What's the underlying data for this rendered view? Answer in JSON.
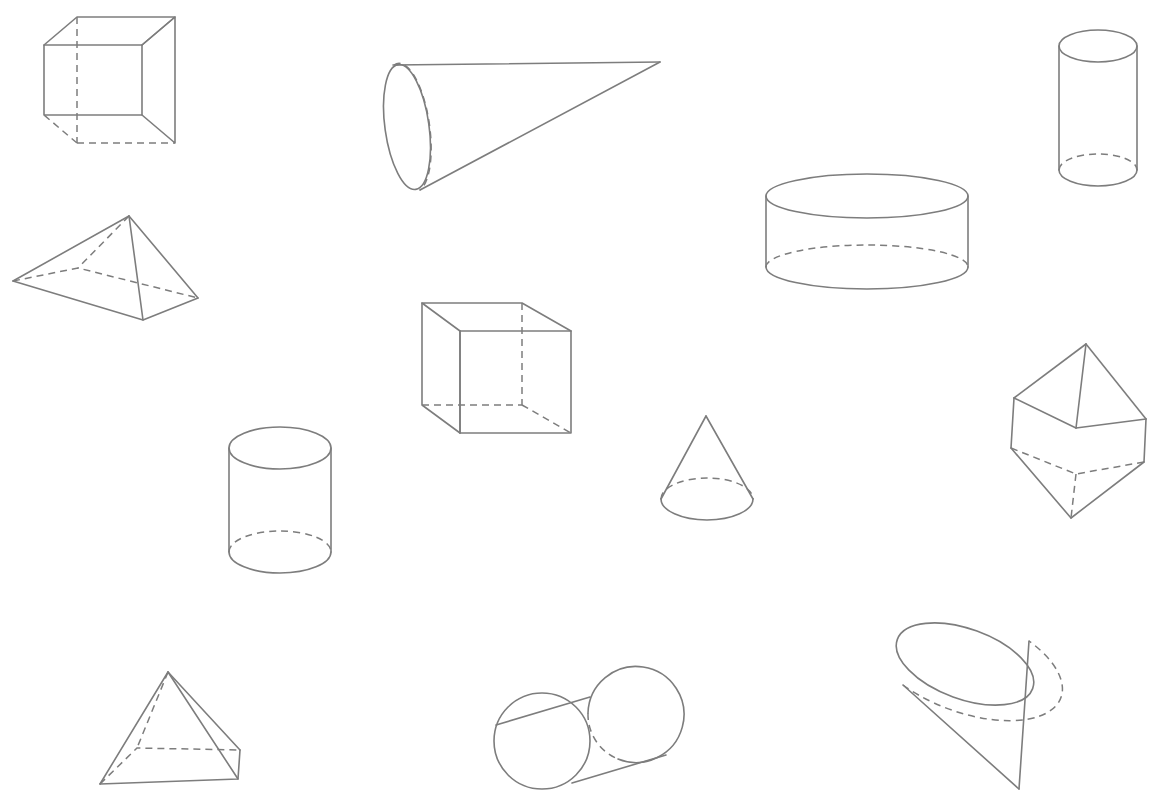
{
  "page": {
    "background_color": "#ffffff",
    "width": 1153,
    "height": 794,
    "line_color": "#7d7d7d",
    "hidden_line_style": "dashed",
    "visible_line_style": "solid"
  },
  "solids": [
    {
      "id": "cube-top-left",
      "name": "Cube",
      "position": "top-left",
      "bbox": [
        44,
        17,
        175,
        115
      ],
      "hidden_edges": 3,
      "orientation": "upright, viewed from above-left"
    },
    {
      "id": "cone-large-horizontal",
      "name": "Cone",
      "position": "top-center",
      "bbox": [
        385,
        62,
        660,
        192
      ],
      "hidden_edges": 1,
      "orientation": "lying on side, apex pointing right"
    },
    {
      "id": "cylinder-tall-right",
      "name": "Cylinder",
      "position": "top-right",
      "bbox": [
        1060,
        30,
        1137,
        186
      ],
      "hidden_edges": 1,
      "orientation": "upright, tall"
    },
    {
      "id": "pyramid-left",
      "name": "Square pyramid",
      "position": "upper-left",
      "bbox": [
        13,
        216,
        198,
        320
      ],
      "hidden_edges": 3,
      "orientation": "tilted, apex up"
    },
    {
      "id": "cylinder-flat-wide",
      "name": "Cylinder",
      "position": "upper-right",
      "bbox": [
        765,
        176,
        969,
        283
      ],
      "hidden_edges": 1,
      "orientation": "upright, wide and short"
    },
    {
      "id": "cube-center",
      "name": "Cube",
      "position": "center",
      "bbox": [
        422,
        303,
        571,
        433
      ],
      "hidden_edges": 3,
      "orientation": "upright, viewed from above-right"
    },
    {
      "id": "cylinder-center-left",
      "name": "Cylinder",
      "position": "center-left",
      "bbox": [
        229,
        427,
        331,
        573
      ],
      "hidden_edges": 1,
      "orientation": "upright"
    },
    {
      "id": "cone-small-upright",
      "name": "Cone",
      "position": "center-right",
      "bbox": [
        661,
        416,
        753,
        520
      ],
      "hidden_edges": 1,
      "orientation": "upright, apex up"
    },
    {
      "id": "cube-tilted-right",
      "name": "Cube",
      "position": "right",
      "bbox": [
        1008,
        344,
        1148,
        519
      ],
      "hidden_edges": 3,
      "orientation": "tilted on a corner"
    },
    {
      "id": "pyramid-bottom-left",
      "name": "Square pyramid",
      "position": "bottom-left",
      "bbox": [
        100,
        672,
        240,
        784
      ],
      "hidden_edges": 3,
      "orientation": "upright, apex up"
    },
    {
      "id": "cylinder-bottom-oblique",
      "name": "Cylinder",
      "position": "bottom-center",
      "bbox": [
        493,
        664,
        684,
        790
      ],
      "hidden_edges": 1,
      "orientation": "lying nearly end-on, tilted"
    },
    {
      "id": "cone-bottom-right",
      "name": "Cone",
      "position": "bottom-right",
      "bbox": [
        903,
        626,
        1023,
        790
      ],
      "hidden_edges": 1,
      "orientation": "tilted, apex pointing down-right"
    }
  ],
  "summary": {
    "total_shapes": 12,
    "cubes": 3,
    "cones": 3,
    "cylinders": 4,
    "pyramids": 2
  }
}
